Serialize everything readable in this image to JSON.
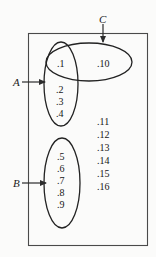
{
  "figure": {
    "type": "venn-set-diagram",
    "background_color": "#fbfbfa",
    "stroke_color": "#3a3a3a"
  },
  "universe": {
    "name": "universe-rectangle",
    "x": 28,
    "y": 33,
    "width": 120,
    "height": 213
  },
  "sets": [
    {
      "id": "A",
      "label": "A",
      "shape": "ellipse",
      "cx": 61,
      "cy": 84,
      "rx": 17,
      "ry": 42,
      "label_x": 13,
      "label_y": 77,
      "arrow": {
        "x1": 22,
        "y1": 82,
        "x2": 45,
        "y2": 82
      },
      "members": [
        ".1",
        ".2",
        ".3",
        ".4"
      ]
    },
    {
      "id": "B",
      "label": "B",
      "shape": "ellipse",
      "cx": 62,
      "cy": 183,
      "rx": 18,
      "ry": 45,
      "label_x": 13,
      "label_y": 178,
      "arrow": {
        "x1": 22,
        "y1": 183,
        "x2": 46,
        "y2": 183
      },
      "members": [
        ".5",
        ".6",
        ".7",
        ".8",
        ".9"
      ]
    },
    {
      "id": "C",
      "label": "C",
      "shape": "ellipse",
      "cx": 89,
      "cy": 62,
      "rx": 43,
      "ry": 19,
      "label_x": 99,
      "label_y": 14,
      "arrow": {
        "x1": 103,
        "y1": 24,
        "x2": 103,
        "y2": 43
      },
      "members": [
        ".1",
        ".10"
      ]
    }
  ],
  "elements": {
    "set_a_only": [
      {
        "text": ".2",
        "x": 56,
        "y": 85
      },
      {
        "text": ".3",
        "x": 56,
        "y": 97
      },
      {
        "text": ".4",
        "x": 56,
        "y": 109
      }
    ],
    "intersection_a_c": [
      {
        "text": ".1",
        "x": 57,
        "y": 59
      }
    ],
    "set_c_only": [
      {
        "text": ".10",
        "x": 97,
        "y": 59
      }
    ],
    "set_b_only": [
      {
        "text": ".5",
        "x": 57,
        "y": 152
      },
      {
        "text": ".6",
        "x": 57,
        "y": 164
      },
      {
        "text": ".7",
        "x": 57,
        "y": 176
      },
      {
        "text": ".8",
        "x": 57,
        "y": 188
      },
      {
        "text": ".9",
        "x": 57,
        "y": 200
      }
    ],
    "outside_all_sets": [
      {
        "text": ".11",
        "x": 97,
        "y": 117
      },
      {
        "text": ".12",
        "x": 97,
        "y": 130
      },
      {
        "text": ".13",
        "x": 97,
        "y": 143
      },
      {
        "text": ".14",
        "x": 97,
        "y": 156
      },
      {
        "text": ".15",
        "x": 97,
        "y": 169
      },
      {
        "text": ".16",
        "x": 97,
        "y": 182
      }
    ]
  }
}
